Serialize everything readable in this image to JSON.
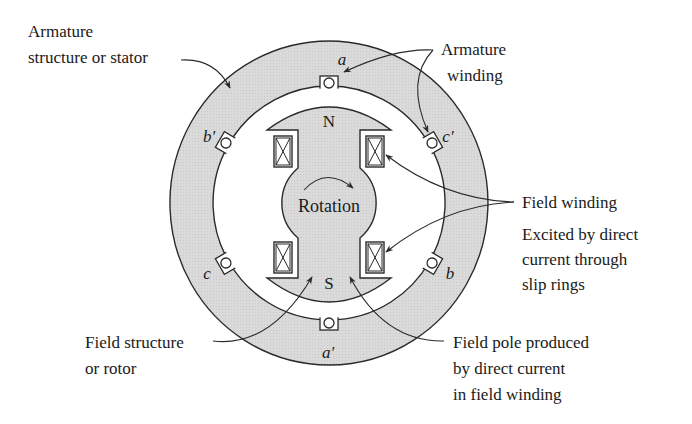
{
  "figure": {
    "type": "synchronous-machine-cross-section",
    "colors": {
      "iron_fill": "#d9d9d9",
      "line": "#2a2a2a",
      "background": "#ffffff",
      "text": "#1a1a1a"
    },
    "slots": [
      {
        "id": "a",
        "label": "a"
      },
      {
        "id": "c_prime",
        "label": "c′"
      },
      {
        "id": "b",
        "label": "b"
      },
      {
        "id": "a_prime",
        "label": "a′"
      },
      {
        "id": "c",
        "label": "c"
      },
      {
        "id": "b_prime",
        "label": "b′"
      }
    ],
    "poles": {
      "north": "N",
      "south": "S"
    },
    "rotation_label": "Rotation",
    "annotations": {
      "stator": [
        "Armature",
        "structure or stator"
      ],
      "armature_winding": [
        "Armature",
        "winding"
      ],
      "field_winding": [
        "Field winding"
      ],
      "excitation": [
        "Excited by direct",
        "current through",
        "slip rings"
      ],
      "rotor": [
        "Field structure",
        "or rotor"
      ],
      "field_pole": [
        "Field pole produced",
        "by direct current",
        "in field winding"
      ]
    }
  }
}
